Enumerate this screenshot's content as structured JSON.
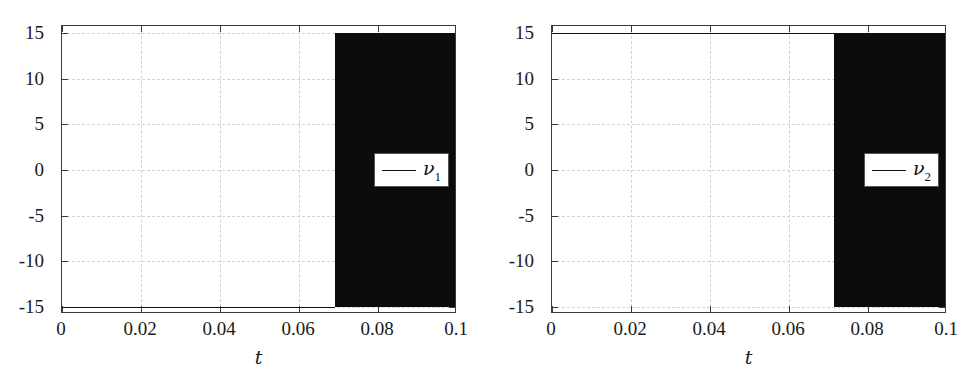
{
  "figure": {
    "background": "#ffffff",
    "axis_color": "#3a3a3a",
    "grid_color": "#d2d2d2",
    "signal_color": "#0c0c0c"
  },
  "chart_data": [
    {
      "type": "line",
      "panel": "left",
      "title": "",
      "xlabel": "t",
      "ylabel": "",
      "xlim": [
        0,
        0.1
      ],
      "ylim": [
        -15.8,
        15.8
      ],
      "grid": true,
      "legend_position": "center right",
      "legend": [
        {
          "name_base": "ν",
          "name_sub": "1",
          "name": "ν₁",
          "color": "#111111"
        }
      ],
      "xticks": [
        0,
        0.02,
        0.04,
        0.06,
        0.08,
        0.1
      ],
      "xticklabels": [
        "0",
        "0.02",
        "0.04",
        "0.06",
        "0.08",
        "0.1"
      ],
      "yticks": [
        15,
        10,
        5,
        0,
        -5,
        -10,
        -15
      ],
      "yticklabels": [
        "15",
        "10",
        "5",
        "0",
        "-5",
        "-10",
        "-15"
      ],
      "series": [
        {
          "name": "ν₁",
          "description": "Saturated at -15 until switching time, then high-frequency bang-bang chattering between -15 and +15",
          "segments": [
            {
              "kind": "constant",
              "x_start": 0.0,
              "x_end": 0.069,
              "value": -15
            },
            {
              "kind": "chatter",
              "x_start": 0.069,
              "x_end": 0.1,
              "min": -15,
              "max": 15
            }
          ],
          "switch_time": 0.069,
          "amplitude": 15
        }
      ]
    },
    {
      "type": "line",
      "panel": "right",
      "title": "",
      "xlabel": "t",
      "ylabel": "",
      "xlim": [
        0,
        0.1
      ],
      "ylim": [
        -15.8,
        15.8
      ],
      "grid": true,
      "legend_position": "center right",
      "legend": [
        {
          "name_base": "ν",
          "name_sub": "2",
          "name": "ν₂",
          "color": "#111111"
        }
      ],
      "xticks": [
        0,
        0.02,
        0.04,
        0.06,
        0.08,
        0.1
      ],
      "xticklabels": [
        "0",
        "0.02",
        "0.04",
        "0.06",
        "0.08",
        "0.1"
      ],
      "yticks": [
        15,
        10,
        5,
        0,
        -5,
        -10,
        -15
      ],
      "yticklabels": [
        "15",
        "10",
        "5",
        "0",
        "-5",
        "-10",
        "-15"
      ],
      "series": [
        {
          "name": "ν₂",
          "description": "Saturated at +15 until switching time, then high-frequency bang-bang chattering between -15 and +15",
          "segments": [
            {
              "kind": "constant",
              "x_start": 0.0,
              "x_end": 0.0714,
              "value": 15
            },
            {
              "kind": "chatter",
              "x_start": 0.0714,
              "x_end": 0.1,
              "min": -15,
              "max": 15
            }
          ],
          "switch_time": 0.0714,
          "amplitude": 15
        }
      ]
    }
  ]
}
